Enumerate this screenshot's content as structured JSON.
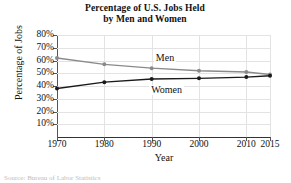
{
  "chart_data": {
    "type": "line",
    "title": "Percentage of U.S. Jobs Held by Men and Women",
    "title_line1": "Percentage of U.S. Jobs Held",
    "title_line2": "by Men and Women",
    "xlabel": "Year",
    "ylabel": "Percentage of Jobs",
    "x": [
      1970,
      1980,
      1990,
      2000,
      2010,
      2015
    ],
    "xtick_labels": [
      "1970",
      "1980",
      "1990",
      "2000",
      "2010",
      "2015"
    ],
    "ytick_labels": [
      "80%",
      "70%",
      "60%",
      "50%",
      "40%",
      "30%",
      "20%",
      "10%"
    ],
    "ytick_values": [
      80,
      70,
      60,
      50,
      40,
      30,
      20,
      10
    ],
    "ylim": [
      0,
      80
    ],
    "xlim": [
      1970,
      2015
    ],
    "grid": true,
    "legend_position": "inline-labels",
    "series": [
      {
        "name": "Men",
        "color": "#8a8a8a",
        "values": [
          62,
          57,
          54,
          52,
          51,
          49
        ]
      },
      {
        "name": "Women",
        "color": "#1a1a1a",
        "values": [
          38,
          43,
          45.5,
          46,
          47,
          48
        ]
      }
    ],
    "annotations": [
      {
        "text": "Men",
        "x": 1993,
        "y": 62
      },
      {
        "text": "Women",
        "x": 1992,
        "y": 37
      }
    ],
    "source": "Source: Bureau of Labor Statistics"
  }
}
